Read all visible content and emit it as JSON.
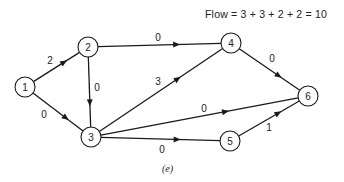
{
  "title": "Flow = 3 + 3 + 2 + 2 = 10",
  "caption": "(e)",
  "nodes": [
    {
      "id": "1",
      "label": "1",
      "x": 25,
      "y": 87
    },
    {
      "id": "2",
      "label": "2",
      "x": 88,
      "y": 47
    },
    {
      "id": "3",
      "label": "3",
      "x": 91,
      "y": 137
    },
    {
      "id": "4",
      "label": "4",
      "x": 231,
      "y": 43
    },
    {
      "id": "5",
      "label": "5",
      "x": 230,
      "y": 141
    },
    {
      "id": "6",
      "label": "6",
      "x": 308,
      "y": 96
    }
  ],
  "edges": [
    {
      "from": "1",
      "to": "2",
      "label": "2",
      "lx": 50,
      "ly": 60
    },
    {
      "from": "1",
      "to": "3",
      "label": "0",
      "lx": 44,
      "ly": 114
    },
    {
      "from": "2",
      "to": "4",
      "label": "0",
      "lx": 158,
      "ly": 37
    },
    {
      "from": "2",
      "to": "3",
      "label": "0",
      "lx": 97,
      "ly": 87
    },
    {
      "from": "3",
      "to": "4",
      "label": "3",
      "lx": 158,
      "ly": 81
    },
    {
      "from": "3",
      "to": "6",
      "label": "0",
      "lx": 204,
      "ly": 108
    },
    {
      "from": "3",
      "to": "5",
      "label": "0",
      "lx": 162,
      "ly": 149
    },
    {
      "from": "4",
      "to": "6",
      "label": "0",
      "lx": 272,
      "ly": 58
    },
    {
      "from": "5",
      "to": "6",
      "label": "1",
      "lx": 269,
      "ly": 127
    }
  ]
}
